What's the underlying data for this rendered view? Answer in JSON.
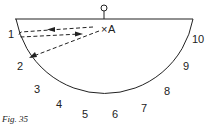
{
  "figure": {
    "caption": "Fig. 35",
    "point_label": "A",
    "point_marker": "×",
    "scale_labels": [
      "1",
      "2",
      "3",
      "4",
      "5",
      "6",
      "7",
      "8",
      "9",
      "10"
    ],
    "colors": {
      "ink": "#222222",
      "background": "#ffffff"
    }
  }
}
